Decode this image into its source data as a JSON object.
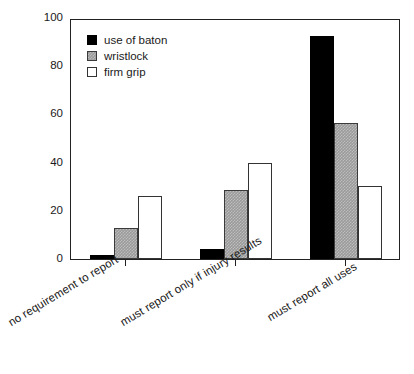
{
  "chart_data": {
    "type": "bar",
    "title": "",
    "xlabel": "",
    "ylabel": "percentage of departments",
    "ylim": [
      0,
      100
    ],
    "yticks": [
      0,
      20,
      40,
      60,
      80,
      100
    ],
    "grid": false,
    "legend_position": "top-left",
    "categories": [
      "no requirement to report",
      "must report only if injury results",
      "must report all uses"
    ],
    "series": [
      {
        "name": "use of baton",
        "color": "#000000",
        "values": [
          1.5,
          4,
          92.5
        ]
      },
      {
        "name": "wristlock",
        "color": "#9a9a9a",
        "values": [
          13,
          28.5,
          56.5
        ]
      },
      {
        "name": "firm grip",
        "color": "#ffffff",
        "values": [
          26,
          40,
          30.5
        ]
      }
    ]
  },
  "axis": {
    "y_title": "percentage of departments",
    "tick_labels": {
      "t0": "0",
      "t20": "20",
      "t40": "40",
      "t60": "60",
      "t80": "80",
      "t100": "100"
    }
  },
  "legend": {
    "items": [
      {
        "label": "use of baton"
      },
      {
        "label": "wristlock"
      },
      {
        "label": "firm grip"
      }
    ]
  }
}
